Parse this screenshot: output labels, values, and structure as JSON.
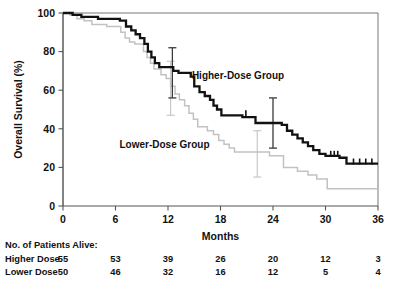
{
  "chart_data": {
    "type": "line",
    "title": "",
    "xlabel": "Months",
    "ylabel": "Overall Survival (%)",
    "xlim": [
      0,
      36
    ],
    "ylim": [
      0,
      100
    ],
    "xticks": [
      0,
      6,
      12,
      18,
      24,
      30,
      36
    ],
    "yticks": [
      0,
      20,
      40,
      60,
      80,
      100
    ],
    "xtick_labels": [
      "0",
      "6",
      "12",
      "18",
      "24",
      "30",
      "36"
    ],
    "ytick_labels": [
      "0",
      "20",
      "40",
      "60",
      "80",
      "100"
    ],
    "grid": false,
    "legend_position": "inline-annotations",
    "series": [
      {
        "name": "Higher-Dose Group",
        "color": "#111111",
        "label_x": 20.0,
        "label_y": 66.0,
        "steps": [
          [
            0.0,
            100
          ],
          [
            1.1,
            100
          ],
          [
            1.1,
            99
          ],
          [
            2.1,
            99
          ],
          [
            2.1,
            98
          ],
          [
            4.0,
            98
          ],
          [
            4.0,
            97
          ],
          [
            6.5,
            97
          ],
          [
            6.5,
            96
          ],
          [
            7.2,
            96
          ],
          [
            7.2,
            93
          ],
          [
            7.8,
            93
          ],
          [
            7.8,
            91
          ],
          [
            8.3,
            91
          ],
          [
            8.3,
            89
          ],
          [
            8.8,
            89
          ],
          [
            8.8,
            87
          ],
          [
            9.3,
            87
          ],
          [
            9.3,
            84
          ],
          [
            9.7,
            84
          ],
          [
            9.7,
            80
          ],
          [
            10.1,
            80
          ],
          [
            10.1,
            77
          ],
          [
            10.5,
            77
          ],
          [
            10.5,
            74
          ],
          [
            11.0,
            74
          ],
          [
            11.0,
            72
          ],
          [
            12.6,
            72
          ],
          [
            12.6,
            70
          ],
          [
            13.2,
            70
          ],
          [
            13.2,
            69
          ],
          [
            14.6,
            69
          ],
          [
            14.6,
            67
          ],
          [
            15.0,
            67
          ],
          [
            15.0,
            62
          ],
          [
            15.6,
            62
          ],
          [
            15.6,
            59
          ],
          [
            16.2,
            59
          ],
          [
            16.2,
            57
          ],
          [
            16.8,
            57
          ],
          [
            16.8,
            55
          ],
          [
            17.2,
            55
          ],
          [
            17.2,
            52
          ],
          [
            17.6,
            52
          ],
          [
            17.6,
            50
          ],
          [
            18.1,
            50
          ],
          [
            18.1,
            47
          ],
          [
            20.5,
            47
          ],
          [
            20.5,
            46
          ],
          [
            22.0,
            46
          ],
          [
            22.0,
            43
          ],
          [
            25.0,
            43
          ],
          [
            25.0,
            42
          ],
          [
            25.6,
            42
          ],
          [
            25.6,
            39
          ],
          [
            26.2,
            39
          ],
          [
            26.2,
            37
          ],
          [
            26.8,
            37
          ],
          [
            26.8,
            35
          ],
          [
            27.4,
            35
          ],
          [
            27.4,
            33
          ],
          [
            28.0,
            33
          ],
          [
            28.0,
            31
          ],
          [
            28.6,
            31
          ],
          [
            28.6,
            29
          ],
          [
            29.3,
            29
          ],
          [
            29.3,
            27
          ],
          [
            30.0,
            27
          ],
          [
            30.0,
            26
          ],
          [
            31.6,
            26
          ],
          [
            31.6,
            25
          ],
          [
            32.4,
            25
          ],
          [
            32.4,
            22
          ],
          [
            36.0,
            22
          ]
        ],
        "censors": [
          [
            20.9,
            47
          ],
          [
            30.6,
            26
          ],
          [
            31.0,
            26
          ],
          [
            31.4,
            26
          ],
          [
            33.2,
            22
          ],
          [
            33.9,
            22
          ],
          [
            34.6,
            22
          ],
          [
            35.3,
            22
          ]
        ],
        "error_bars": [
          {
            "x": 12.5,
            "y": 72,
            "low": 56,
            "high": 82
          },
          {
            "x": 24.0,
            "y": 43,
            "low": 30,
            "high": 56
          }
        ]
      },
      {
        "name": "Lower-Dose Group",
        "color": "#c2c2c2",
        "label_x": 11.6,
        "label_y": 30.0,
        "steps": [
          [
            0.0,
            100
          ],
          [
            0.8,
            100
          ],
          [
            0.8,
            99
          ],
          [
            1.6,
            99
          ],
          [
            1.6,
            97
          ],
          [
            2.4,
            97
          ],
          [
            2.4,
            96
          ],
          [
            3.3,
            96
          ],
          [
            3.3,
            94
          ],
          [
            5.0,
            94
          ],
          [
            5.0,
            93
          ],
          [
            6.6,
            93
          ],
          [
            6.6,
            90
          ],
          [
            7.1,
            90
          ],
          [
            7.1,
            87
          ],
          [
            7.6,
            87
          ],
          [
            7.6,
            85
          ],
          [
            8.2,
            85
          ],
          [
            8.2,
            84
          ],
          [
            9.2,
            84
          ],
          [
            9.2,
            80
          ],
          [
            9.6,
            80
          ],
          [
            9.6,
            77
          ],
          [
            10.0,
            77
          ],
          [
            10.0,
            74
          ],
          [
            10.4,
            74
          ],
          [
            10.4,
            71
          ],
          [
            11.2,
            71
          ],
          [
            11.2,
            68
          ],
          [
            11.8,
            68
          ],
          [
            11.8,
            66
          ],
          [
            12.3,
            66
          ],
          [
            12.3,
            62
          ],
          [
            12.8,
            62
          ],
          [
            12.8,
            58
          ],
          [
            13.3,
            58
          ],
          [
            13.3,
            55
          ],
          [
            13.9,
            55
          ],
          [
            13.9,
            52
          ],
          [
            14.4,
            52
          ],
          [
            14.4,
            48
          ],
          [
            14.9,
            48
          ],
          [
            14.9,
            45
          ],
          [
            15.4,
            45
          ],
          [
            15.4,
            41
          ],
          [
            16.5,
            41
          ],
          [
            16.5,
            39
          ],
          [
            17.2,
            39
          ],
          [
            17.2,
            37
          ],
          [
            17.8,
            37
          ],
          [
            17.8,
            34
          ],
          [
            18.4,
            34
          ],
          [
            18.4,
            32
          ],
          [
            19.0,
            32
          ],
          [
            19.0,
            30
          ],
          [
            19.6,
            30
          ],
          [
            19.6,
            28
          ],
          [
            23.6,
            28
          ],
          [
            23.6,
            26
          ],
          [
            25.2,
            26
          ],
          [
            25.2,
            20
          ],
          [
            26.8,
            20
          ],
          [
            26.8,
            18
          ],
          [
            28.0,
            18
          ],
          [
            28.0,
            16
          ],
          [
            29.0,
            16
          ],
          [
            29.0,
            14
          ],
          [
            30.2,
            14
          ],
          [
            30.2,
            9
          ],
          [
            36.0,
            9
          ]
        ],
        "censors": [],
        "error_bars": [
          {
            "x": 12.3,
            "y": 62,
            "low": 47,
            "high": 75
          },
          {
            "x": 22.2,
            "y": 27,
            "low": 15,
            "high": 39
          }
        ]
      }
    ]
  },
  "risk_table": {
    "heading": "No. of Patients Alive:",
    "time_points": [
      0,
      6,
      12,
      18,
      24,
      30,
      36
    ],
    "rows": [
      {
        "label": "Higher Dose",
        "counts": [
          "55",
          "53",
          "39",
          "26",
          "20",
          "12",
          "3"
        ]
      },
      {
        "label": "Lower Dose",
        "counts": [
          "50",
          "46",
          "32",
          "16",
          "12",
          "5",
          "4"
        ]
      }
    ]
  }
}
